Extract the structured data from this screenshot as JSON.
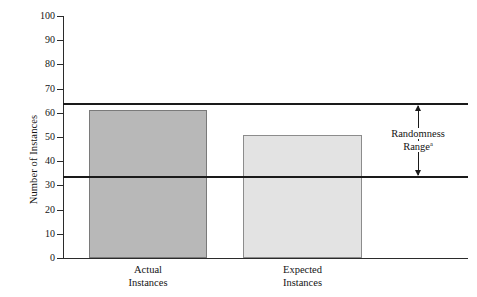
{
  "chart_data": {
    "type": "bar",
    "title": "",
    "subtitle": "",
    "xlabel": "",
    "ylabel": "Number of Instances",
    "categories": [
      "Actual Instances",
      "Expected Instances"
    ],
    "category_lines": [
      [
        "Actual",
        "Instances"
      ],
      [
        "Expected",
        "Instances"
      ]
    ],
    "values": [
      61,
      51
    ],
    "series": [
      {
        "name": "Instances",
        "values": [
          61,
          51
        ],
        "colors": [
          "#b8b8b8",
          "#e3e3e3"
        ]
      }
    ],
    "ylim": [
      0,
      100
    ],
    "ytick_step": 10,
    "ytick_labels": [
      "100",
      "90",
      "80",
      "70",
      "60",
      "50",
      "40",
      "30",
      "20",
      "10",
      "0"
    ],
    "ytick_values": [
      100,
      90,
      80,
      70,
      60,
      50,
      40,
      30,
      20,
      10,
      0
    ],
    "grid": false,
    "legend": "none",
    "reference_lines": [
      {
        "name": "randomness-upper",
        "value": 63.5
      },
      {
        "name": "randomness-lower",
        "value": 33.5
      }
    ],
    "annotations": [
      {
        "name": "randomness-range",
        "text_line_1": "Randomness",
        "text_line_2": "Range",
        "footnote_marker": "a",
        "arrow": "double-headed-vertical",
        "from_value": 33.5,
        "to_value": 63.5
      }
    ],
    "colors": {
      "actual_bar_fill": "#b8b8b8",
      "actual_bar_stroke": "#7a7a7a",
      "expected_bar_fill": "#e3e3e3",
      "expected_bar_stroke": "#8c8c8c",
      "axis": "#2b2b2b",
      "reference_line": "#1a1a1a",
      "background": "#ffffff",
      "text": "#141414"
    }
  }
}
